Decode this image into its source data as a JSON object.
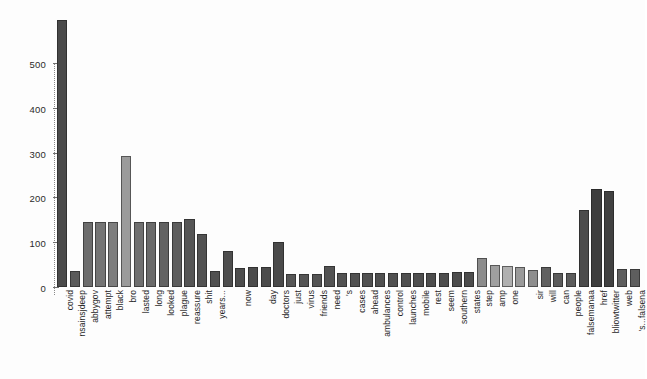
{
  "chart_data": {
    "type": "bar",
    "title": "",
    "subtitle": "",
    "xlabel": "",
    "ylabel": "",
    "ylim": [
      0,
      620
    ],
    "grid": false,
    "legend": null,
    "yticks": [
      0,
      100,
      200,
      300,
      400,
      500
    ],
    "ytick_labels": [
      "0",
      "100",
      "200",
      "300",
      "400",
      "500"
    ],
    "categories": [
      "covid",
      "nsainsjdeep",
      "abbygov",
      "attempt",
      "black",
      "bro",
      "lasted",
      "long",
      "looked",
      "plague",
      "reassure",
      "shit",
      "years...",
      "",
      "now",
      "",
      "day",
      "doctors",
      "just",
      "virus",
      "friends",
      "need",
      "'s",
      "cases",
      "ahead",
      "ambulances",
      "control",
      "launches",
      "mobile",
      "rest",
      "seem",
      "southern",
      "states",
      "step",
      "amp",
      "one",
      "",
      "sir",
      "will",
      "can",
      "people",
      "falsemanaa",
      "href",
      "bliowtwitter",
      "web",
      "'s...falsena"
    ],
    "values": [
      595,
      36,
      146,
      146,
      146,
      292,
      146,
      146,
      146,
      146,
      152,
      119,
      35,
      80,
      42,
      45,
      45,
      100,
      30,
      30,
      30,
      46,
      31,
      31,
      31,
      31,
      31,
      31,
      31,
      31,
      31,
      34,
      34,
      65,
      50,
      48,
      44,
      37,
      45,
      32,
      32,
      172,
      218,
      214,
      40,
      40
    ],
    "bar_colors": [
      "#4a4a4a",
      "#5a5a5a",
      "#6d6d6d",
      "#757575",
      "#7e7e7e",
      "#9b9b9b",
      "#707070",
      "#6a6a6a",
      "#626262",
      "#5e5e5e",
      "#565656",
      "#525252",
      "#505050",
      "#4e4e4e",
      "#4d4d4d",
      "#4c4c4c",
      "#4b4b4b",
      "#4a4a4a",
      "#565656",
      "#555555",
      "#545454",
      "#535353",
      "#525252",
      "#515151",
      "#515151",
      "#505050",
      "#505050",
      "#4f4f4f",
      "#4f4f4f",
      "#4e4e4e",
      "#4e4e4e",
      "#4d4d4d",
      "#4d4d4d",
      "#8c8c8c",
      "#9f9f9f",
      "#b0b0b0",
      "#9a9a9a",
      "#8e8e8e",
      "#616161",
      "#5c5c5c",
      "#5c5c5c",
      "#4b4b4b",
      "#3d3d3d",
      "#414141",
      "#5e5e5e",
      "#5e5e5e"
    ],
    "axis_color": "#6f6f6f",
    "background_color": "#ffffff"
  }
}
